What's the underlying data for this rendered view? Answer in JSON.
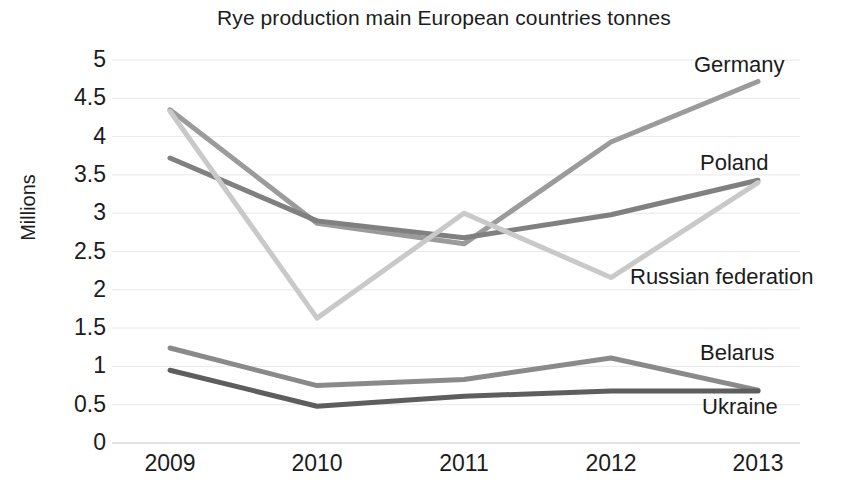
{
  "chart_data": {
    "type": "line",
    "title": "Rye production main European countries tonnes",
    "xlabel": "",
    "ylabel": "Millions",
    "categories": [
      "2009",
      "2010",
      "2011",
      "2012",
      "2013"
    ],
    "ylim": [
      0,
      5
    ],
    "ytick_labels": [
      "5",
      "4.5",
      "4",
      "3.5",
      "3",
      "2.5",
      "2",
      "1.5",
      "1",
      "0.5",
      "0"
    ],
    "ytick_values": [
      5,
      4.5,
      4,
      3.5,
      3,
      2.5,
      2,
      1.5,
      1,
      0.5,
      0
    ],
    "grid": true,
    "legend_position": "inline-right-end-labels",
    "series": [
      {
        "name": "Germany",
        "color": "#9b9b9b",
        "values": [
          4.35,
          2.87,
          2.6,
          3.93,
          4.72
        ]
      },
      {
        "name": "Poland",
        "color": "#808080",
        "values": [
          3.72,
          2.9,
          2.68,
          2.98,
          3.43
        ]
      },
      {
        "name": "Russian federation",
        "color": "#c9c9c9",
        "values": [
          4.33,
          1.63,
          3.0,
          2.16,
          3.4
        ]
      },
      {
        "name": "Belarus",
        "color": "#8a8a8a",
        "values": [
          1.24,
          0.75,
          0.83,
          1.11,
          0.69
        ]
      },
      {
        "name": "Ukraine",
        "color": "#5e5e5e",
        "values": [
          0.95,
          0.48,
          0.61,
          0.68,
          0.68
        ]
      }
    ],
    "series_labels": [
      {
        "text": "Germany",
        "x": 694,
        "y": 54
      },
      {
        "text": "Poland",
        "x": 700,
        "y": 152
      },
      {
        "text": "Russian federation",
        "x": 630,
        "y": 266
      },
      {
        "text": "Belarus",
        "x": 700,
        "y": 342
      },
      {
        "text": "Ukraine",
        "x": 702,
        "y": 396
      }
    ],
    "axis_color": "#d9d9d9",
    "grid_color": "#e8e8e8",
    "text_color": "#1c1c1c",
    "background": "#ffffff"
  }
}
